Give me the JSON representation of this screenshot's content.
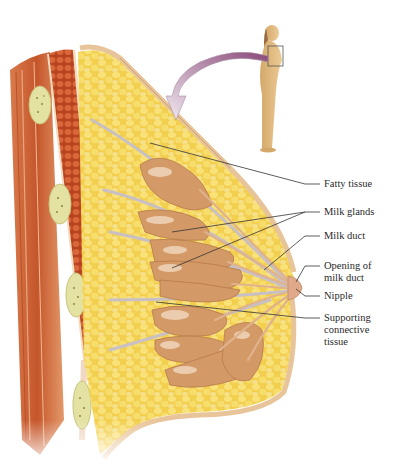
{
  "diagram": {
    "inset": {
      "description": "Standing female figure, side view, with box around chest",
      "arrow": "curved arrow from inset to cross-section"
    },
    "labels": [
      {
        "id": "fatty-tissue",
        "text": "Fatty tissue",
        "x": 326,
        "y": 178,
        "target": [
          150,
          143
        ],
        "elbow": [
          305,
          184
        ]
      },
      {
        "id": "milk-glands",
        "text": "Milk glands",
        "x": 326,
        "y": 206,
        "targets": [
          [
            172,
            232
          ],
          [
            172,
            268
          ]
        ],
        "elbow": [
          305,
          212
        ]
      },
      {
        "id": "milk-duct",
        "text": "Milk duct",
        "x": 326,
        "y": 230,
        "target": [
          264,
          270
        ],
        "elbow": [
          305,
          236
        ]
      },
      {
        "id": "opening-of-milk-duct",
        "text": "Opening of\nmilk duct",
        "x": 326,
        "y": 260,
        "target": [
          296,
          282
        ],
        "elbow": [
          305,
          266
        ]
      },
      {
        "id": "nipple",
        "text": "Nipple",
        "x": 326,
        "y": 290,
        "target": [
          296,
          289
        ],
        "elbow": [
          305,
          296
        ]
      },
      {
        "id": "supporting-connective-tissue",
        "text": "Supporting\nconnective\ntissue",
        "x": 326,
        "y": 312,
        "target": [
          156,
          302
        ],
        "elbow": [
          305,
          318
        ]
      }
    ],
    "colors": {
      "fat": "#f2d35a",
      "fat_light": "#f9e88e",
      "muscle": "#c8532a",
      "muscle_dark": "#a8401f",
      "gland": "#d49a6a",
      "gland_light": "#f0d2b4",
      "skin": "#e8c9a0",
      "rib": "#e6e2a0",
      "arrow": "#9a5a86",
      "leader": "#333333"
    }
  }
}
